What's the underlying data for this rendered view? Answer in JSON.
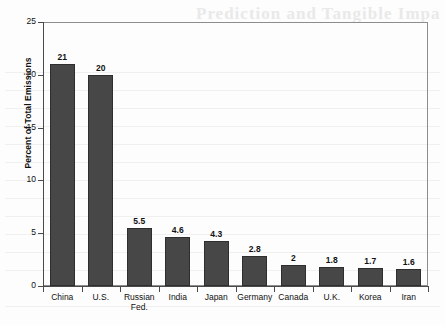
{
  "chart_data": {
    "type": "bar",
    "title": "",
    "xlabel": "",
    "ylabel": "Percent of Total Emissions",
    "ylim": [
      0,
      25
    ],
    "yticks": [
      0,
      5,
      10,
      15,
      20,
      25
    ],
    "grid": false,
    "legend": false,
    "categories": [
      "China",
      "U.S.",
      "Russian Fed.",
      "India",
      "Japan",
      "Germany",
      "Canada",
      "U.K.",
      "Korea",
      "Iran"
    ],
    "values": [
      21,
      20,
      5.5,
      4.6,
      4.3,
      2.8,
      2,
      1.8,
      1.7,
      1.6
    ],
    "value_labels": [
      "21",
      "20",
      "5.5",
      "4.6",
      "4.3",
      "2.8",
      "2",
      "1.8",
      "1.7",
      "1.6"
    ],
    "bar_color": "#474747",
    "axis_color": "#4a4a4a",
    "background_color": "#fdfdfd"
  },
  "background_artifacts": {
    "bleed_title": "Prediction and Tangible Impa"
  }
}
